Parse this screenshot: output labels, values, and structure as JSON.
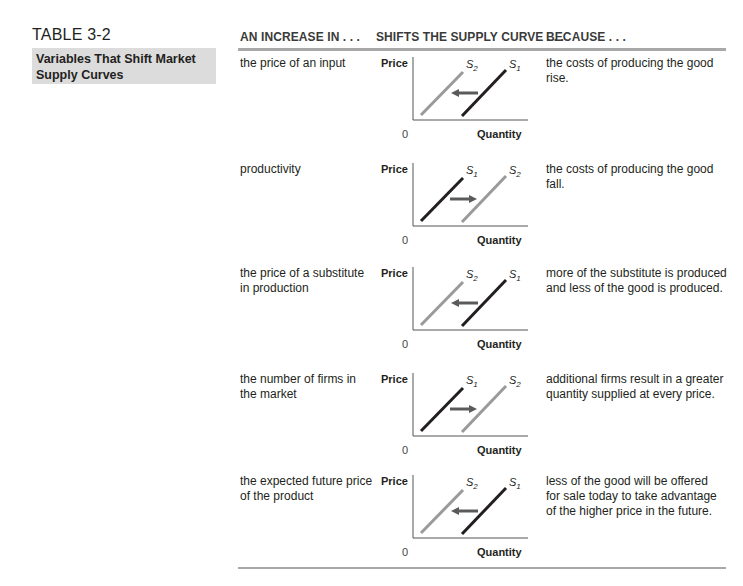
{
  "table": {
    "label": "TABLE 3-2",
    "caption": [
      "Variables That Shift Market",
      "Supply Curves"
    ]
  },
  "headers": {
    "col1": "AN INCREASE IN . . .",
    "col2": "SHIFTS THE SUPPLY CURVE . . .",
    "col3": "BECAUSE . . ."
  },
  "graph_labels": {
    "y_axis": "Price",
    "x_axis": "Quantity",
    "origin": "0"
  },
  "colors": {
    "original_curve": "#231f20",
    "shifted_curve": "#9a9a9a",
    "arrow": "#5a5a5a",
    "caption_bg": "#dcdcdc",
    "rule": "#a8a8a8"
  },
  "rows": [
    {
      "variable": [
        "the price of an input"
      ],
      "shift": "left",
      "left_curve": "S2",
      "right_curve": "S1",
      "reason": [
        "the costs of producing the good",
        "rise."
      ]
    },
    {
      "variable": [
        "productivity"
      ],
      "shift": "right",
      "left_curve": "S1",
      "right_curve": "S2",
      "reason": [
        "the costs of producing the good",
        "fall."
      ]
    },
    {
      "variable": [
        "the price of a substitute",
        "in production"
      ],
      "shift": "left",
      "left_curve": "S2",
      "right_curve": "S1",
      "reason": [
        "more of the substitute is produced",
        "and less of the good is produced."
      ]
    },
    {
      "variable": [
        "the number of firms in",
        "the market"
      ],
      "shift": "right",
      "left_curve": "S1",
      "right_curve": "S2",
      "reason": [
        "additional firms result in a greater",
        "quantity supplied at every price."
      ]
    },
    {
      "variable": [
        "the expected future price",
        "of the product"
      ],
      "shift": "left",
      "left_curve": "S2",
      "right_curve": "S1",
      "reason": [
        "less of the good will be offered",
        "for sale today to take advantage",
        "of the higher price in the future."
      ]
    }
  ]
}
